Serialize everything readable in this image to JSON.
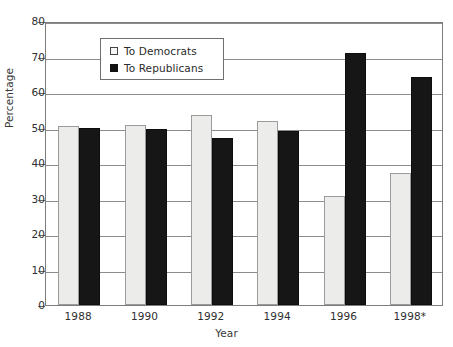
{
  "chart_data": {
    "type": "bar",
    "title": "",
    "xlabel": "Year",
    "ylabel": "Percentage",
    "categories": [
      "1988",
      "1990",
      "1992",
      "1994",
      "1996",
      "1998*"
    ],
    "series": [
      {
        "name": "To Democrats",
        "color": "#ececea",
        "values": [
          50.3,
          50.7,
          53.5,
          51.8,
          30.7,
          37.2
        ]
      },
      {
        "name": "To Republicans",
        "color": "#161616",
        "values": [
          50.0,
          49.6,
          47.0,
          49.0,
          71.0,
          64.2
        ]
      }
    ],
    "ylim": [
      0,
      80
    ],
    "yticks": [
      0,
      10,
      20,
      30,
      40,
      50,
      60,
      70,
      80
    ],
    "ytick_labels": [
      "0",
      "10",
      "20",
      "30",
      "40",
      "50",
      "60",
      "70",
      "80"
    ],
    "grid": true,
    "legend_position": "upper-left-inside"
  },
  "legend": {
    "items": [
      {
        "label": "To Democrats",
        "marker": "open-square-marker"
      },
      {
        "label": "To Republicans",
        "marker": "filled-square-marker"
      }
    ]
  }
}
